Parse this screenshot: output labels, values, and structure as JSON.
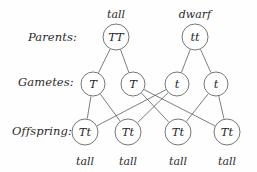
{
  "diagram": {
    "title_artifact": "g",
    "row_labels": [
      {
        "name": "parents",
        "text": "Parents:",
        "x": 28,
        "y": 30
      },
      {
        "name": "gametes",
        "text": "Gametes:",
        "x": 18,
        "y": 75
      },
      {
        "name": "offspring",
        "text": "Offspring:",
        "x": 12,
        "y": 124
      }
    ],
    "parents": {
      "nodes": [
        {
          "id": "p1",
          "genotype": "TT",
          "cx": 116,
          "cy": 37,
          "r": 13
        },
        {
          "id": "p2",
          "genotype": "tt",
          "cx": 195,
          "cy": 37,
          "r": 13
        }
      ],
      "phenotypes": [
        {
          "text": "tall",
          "x": 94,
          "y": 8
        },
        {
          "text": "dwarf",
          "x": 173,
          "y": 8
        }
      ]
    },
    "gametes": {
      "nodes": [
        {
          "id": "g1",
          "genotype": "T",
          "cx": 93,
          "cy": 84,
          "r": 12
        },
        {
          "id": "g2",
          "genotype": "T",
          "cx": 133,
          "cy": 84,
          "r": 12
        },
        {
          "id": "g3",
          "genotype": "t",
          "cx": 177,
          "cy": 84,
          "r": 12
        },
        {
          "id": "g4",
          "genotype": "t",
          "cx": 216,
          "cy": 84,
          "r": 12
        }
      ]
    },
    "offspring": {
      "nodes": [
        {
          "id": "o1",
          "genotype": "Tt",
          "cx": 85,
          "cy": 132,
          "r": 13
        },
        {
          "id": "o2",
          "genotype": "Tt",
          "cx": 128,
          "cy": 132,
          "r": 13
        },
        {
          "id": "o3",
          "genotype": "Tt",
          "cx": 178,
          "cy": 132,
          "r": 13
        },
        {
          "id": "o4",
          "genotype": "Tt",
          "cx": 227,
          "cy": 132,
          "r": 13
        }
      ],
      "phenotypes": [
        {
          "text": "tall",
          "x": 63,
          "y": 155
        },
        {
          "text": "tall",
          "x": 106,
          "y": 155
        },
        {
          "text": "tall",
          "x": 156,
          "y": 155
        },
        {
          "text": "tall",
          "x": 205,
          "y": 155
        }
      ]
    },
    "edges": [
      {
        "from": "p1",
        "to": "g1"
      },
      {
        "from": "p1",
        "to": "g2"
      },
      {
        "from": "p2",
        "to": "g3"
      },
      {
        "from": "p2",
        "to": "g4"
      },
      {
        "from": "g1",
        "to": "o1"
      },
      {
        "from": "g1",
        "to": "o2"
      },
      {
        "from": "g2",
        "to": "o3"
      },
      {
        "from": "g2",
        "to": "o4"
      },
      {
        "from": "g3",
        "to": "o1"
      },
      {
        "from": "g3",
        "to": "o2"
      },
      {
        "from": "g4",
        "to": "o3"
      },
      {
        "from": "g4",
        "to": "o4"
      }
    ],
    "colors": {
      "stroke": "#5d5d5d",
      "text": "#2b2b2b",
      "background": "#fefefe"
    }
  }
}
